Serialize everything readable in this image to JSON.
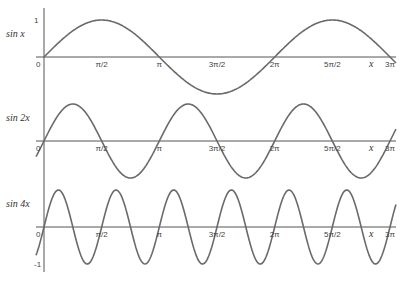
{
  "chart_data": [
    {
      "type": "line",
      "title": "",
      "ylabel": "sin x",
      "xlabel": "x",
      "function": "sin(x)",
      "x_range": [
        0,
        9.4248
      ],
      "ylim": [
        -1,
        1
      ],
      "xticks": [
        "0",
        "π/2",
        "π",
        "3π/2",
        "2π",
        "5π/2",
        "3π"
      ],
      "yticks": [
        "1"
      ],
      "grid": false
    },
    {
      "type": "line",
      "title": "",
      "ylabel": "sin 2x",
      "xlabel": "x",
      "function": "sin(2x)",
      "x_range": [
        0,
        9.4248
      ],
      "ylim": [
        -1,
        1
      ],
      "xticks": [
        "0",
        "π/2",
        "π",
        "3π/2",
        "2π",
        "5π/2",
        "3π"
      ],
      "grid": false
    },
    {
      "type": "line",
      "title": "",
      "ylabel": "sin 4x",
      "xlabel": "x",
      "function": "sin(4x)",
      "x_range": [
        0,
        9.4248
      ],
      "ylim": [
        -1,
        1
      ],
      "xticks": [
        "0",
        "π/2",
        "π",
        "3π/2",
        "2π",
        "5π/2",
        "3π"
      ],
      "yticks": [
        "-1"
      ],
      "grid": false
    }
  ],
  "panels": [
    {
      "ylabel": "sin x",
      "freq": 1,
      "axis_y": 57,
      "amp": 37,
      "ytick_label": "1",
      "ytick_pos": "top"
    },
    {
      "ylabel": "sin 2x",
      "freq": 2,
      "axis_y": 141,
      "amp": 37,
      "ytick_label": "",
      "ytick_pos": ""
    },
    {
      "ylabel": "sin 4x",
      "freq": 4,
      "axis_y": 227,
      "amp": 37,
      "ytick_label": "-1",
      "ytick_pos": "bottom"
    }
  ],
  "xticks": [
    "0",
    "π/2",
    "π",
    "3π/2",
    "2π",
    "5π/2",
    "3π"
  ],
  "xvar": "x",
  "colors": {
    "curve": "#6a6a6a",
    "axis": "#555555"
  }
}
